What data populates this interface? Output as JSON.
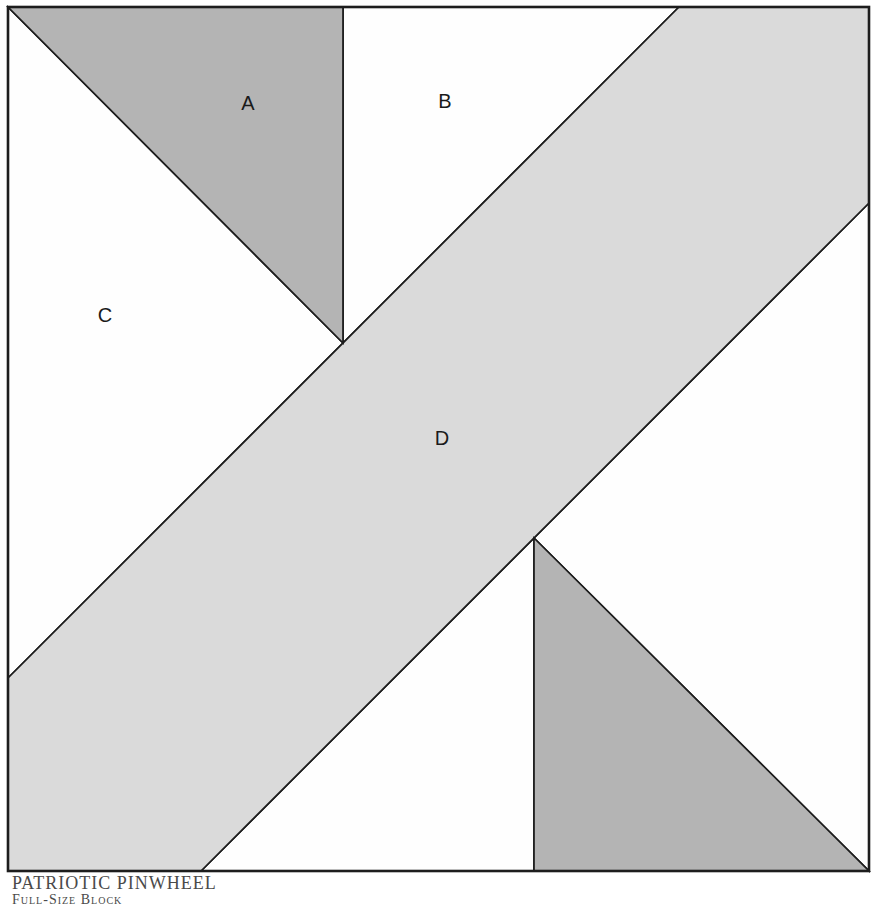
{
  "diagram": {
    "piece_labels": {
      "a": "A",
      "b": "B",
      "c": "C",
      "d": "D"
    },
    "caption": {
      "title": "PATRIOTIC PINWHEEL",
      "subtitle": "Full-Size Block"
    },
    "colors": {
      "dark_piece": "#b4b4b4",
      "band_piece": "#dadada",
      "light_piece": "#fefefe",
      "outline": "#1d1d1d",
      "label_text": "#1a1a1a",
      "caption_text": "#4a4a4a"
    }
  }
}
